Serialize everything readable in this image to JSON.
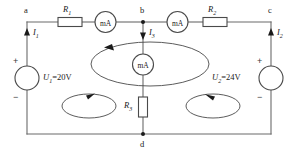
{
  "diagram": {
    "type": "dc-circuit-schematic",
    "nodes": [
      {
        "id": "a",
        "label": "a"
      },
      {
        "id": "b",
        "label": "b"
      },
      {
        "id": "c",
        "label": "c"
      },
      {
        "id": "d",
        "label": "d"
      }
    ],
    "resistors": [
      {
        "id": "R1",
        "name": "R",
        "subscript": "1"
      },
      {
        "id": "R2",
        "name": "R",
        "subscript": "2"
      },
      {
        "id": "R3",
        "name": "R",
        "subscript": "3"
      }
    ],
    "sources": [
      {
        "id": "U1",
        "name": "U",
        "subscript": "1",
        "value": "=20V",
        "plus": "+",
        "minus": "−"
      },
      {
        "id": "U2",
        "name": "U",
        "subscript": "2",
        "value": "=24V",
        "plus": "+",
        "minus": "−"
      }
    ],
    "currents": [
      {
        "id": "I1",
        "name": "I",
        "subscript": "1",
        "direction": "up"
      },
      {
        "id": "I2",
        "name": "I",
        "subscript": "2",
        "direction": "up"
      },
      {
        "id": "I3",
        "name": "I",
        "subscript": "3",
        "direction": "down"
      }
    ],
    "meters": [
      {
        "id": "meter-left",
        "label": "mA"
      },
      {
        "id": "meter-right",
        "label": "mA"
      },
      {
        "id": "meter-middle",
        "label": "mA"
      }
    ],
    "loops": [
      {
        "id": "loop-center",
        "direction": "counter-clockwise"
      },
      {
        "id": "loop-left",
        "direction": "clockwise"
      },
      {
        "id": "loop-right",
        "direction": "counter-clockwise"
      }
    ],
    "colors": {
      "wire": "#6b6b6b",
      "component": "#4a4a4a",
      "text": "#1a1a1a",
      "background": "#ffffff"
    }
  }
}
